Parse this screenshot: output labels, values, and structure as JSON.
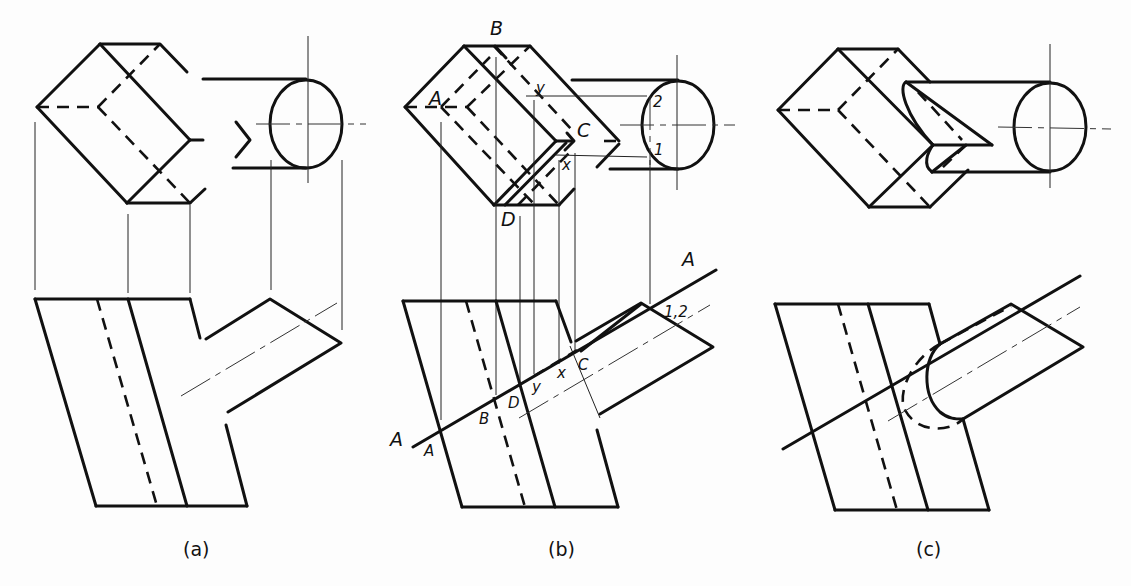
{
  "figure": {
    "panels": [
      {
        "id": "a",
        "caption": "(a)",
        "labels": []
      },
      {
        "id": "b",
        "caption": "(b)",
        "top_view_labels": {
          "A": "A",
          "B": "B",
          "C": "C",
          "D": "D",
          "x": "x",
          "y": "y",
          "p1": "1",
          "p2": "2"
        },
        "front_view_labels": {
          "plane_left": "A",
          "plane_right": "A",
          "A": "A",
          "B": "B",
          "C": "C",
          "D": "D",
          "x": "x",
          "y": "y",
          "p12": "1,2"
        }
      },
      {
        "id": "c",
        "caption": "(c)",
        "labels": []
      }
    ]
  }
}
